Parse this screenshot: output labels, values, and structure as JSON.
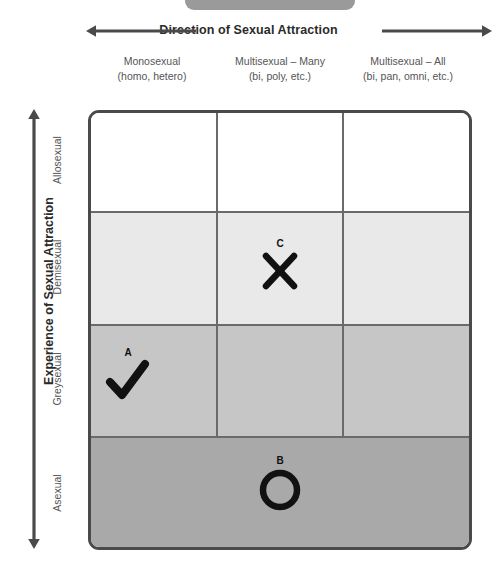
{
  "top_pill": {
    "color": "#9a9a9a"
  },
  "x_axis": {
    "title": "Direction of Sexual Attraction",
    "left_arrow_icon": "arrow-left-icon",
    "right_arrow_icon": "arrow-right-icon",
    "columns": [
      {
        "line1": "Monosexual",
        "line2": "(homo, hetero)"
      },
      {
        "line1": "Multisexual – Many",
        "line2": "(bi, poly, etc.)"
      },
      {
        "line1": "Multisexual – All",
        "line2": "(bi, pan, omni, etc.)"
      }
    ]
  },
  "y_axis": {
    "title": "Experience of Sexual Attraction",
    "arrow_icon": "arrow-up-down-icon",
    "rows": [
      {
        "label": "Allosexual",
        "fill": "#ffffff"
      },
      {
        "label": "Demisexual",
        "fill": "#e9e9e9"
      },
      {
        "label": "Greysexual",
        "fill": "#c6c6c6"
      },
      {
        "label": "Asexual",
        "fill": "#a9a9a9"
      }
    ]
  },
  "grid": {
    "border_color": "#4a4a4a",
    "divider_color": "#6a6a6a",
    "rows": 4,
    "columns": 3
  },
  "marks": [
    {
      "letter": "A",
      "glyph": "✔",
      "shape": "checkmark",
      "row": "Greysexual",
      "column": "Monosexual",
      "color": "#111111"
    },
    {
      "letter": "B",
      "glyph": "◯",
      "shape": "circle",
      "row": "Asexual",
      "column": "all (full width)",
      "color": "#111111"
    },
    {
      "letter": "C",
      "glyph": "✕",
      "shape": "cross",
      "row": "Demisexual",
      "column": "Multisexual – Many",
      "color": "#111111"
    }
  ]
}
